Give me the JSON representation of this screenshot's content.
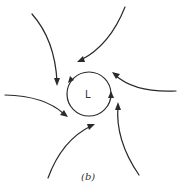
{
  "figure": {
    "center_label": "L",
    "caption": "(b)",
    "line_color": "#2a2a2a",
    "background": "#ffffff"
  },
  "elements": {
    "center_circle": {
      "cx": 89,
      "cy": 94,
      "r": 22,
      "direction": "counterclockwise"
    },
    "inflow_arrows": [
      {
        "name": "top-left",
        "from": [
          32,
          14
        ],
        "to": [
          57,
          84
        ]
      },
      {
        "name": "top-right",
        "from": [
          125,
          7
        ],
        "to": [
          79,
          61
        ]
      },
      {
        "name": "right",
        "from": [
          176,
          91
        ],
        "to": [
          113,
          74
        ]
      },
      {
        "name": "left",
        "from": [
          5,
          95
        ],
        "to": [
          67,
          116
        ]
      },
      {
        "name": "bottom-left",
        "from": [
          48,
          178
        ],
        "to": [
          94,
          124
        ]
      },
      {
        "name": "bottom-right",
        "from": [
          139,
          175
        ],
        "to": [
          118,
          103
        ]
      }
    ]
  }
}
